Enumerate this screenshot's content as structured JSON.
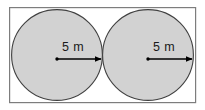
{
  "figure": {
    "background_color": "#ffffff",
    "rectangle": {
      "name": "bounding-rectangle",
      "x": 9,
      "y": 7,
      "width": 187,
      "height": 96,
      "stroke_color": "#7d7d7d",
      "fill_color": "#ffffff",
      "stroke_width": 1.2
    },
    "circles": [
      {
        "name": "left-circle",
        "cx": 57,
        "cy": 55,
        "r": 45.5,
        "fill_color": "#d2d2d2",
        "stroke_color": "#404040",
        "stroke_width": 1.1
      },
      {
        "name": "right-circle",
        "cx": 148,
        "cy": 55,
        "r": 45.5,
        "fill_color": "#d2d2d2",
        "stroke_color": "#404040",
        "stroke_width": 1.1
      }
    ],
    "radius_arrows": [
      {
        "name": "left-radius-arrow",
        "label": "5 m",
        "from_x": 57,
        "from_y": 59,
        "to_x": 102,
        "to_y": 59,
        "color": "#000000"
      },
      {
        "name": "right-radius-arrow",
        "label": "5 m",
        "from_x": 148,
        "from_y": 59,
        "to_x": 193,
        "to_y": 59,
        "color": "#000000"
      }
    ],
    "labels": {
      "left_radius": "5 m",
      "right_radius": "5 m"
    },
    "measurement": {
      "value": "5",
      "unit": "m",
      "quantity": "radius"
    }
  }
}
